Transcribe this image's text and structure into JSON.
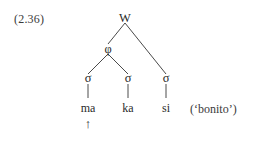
{
  "figure": {
    "example_number": "(2.36)",
    "gloss": "(‘bonito’)",
    "stroke_color": "#4a4a4a",
    "text_color": "#2b2b2b",
    "background_color": "#ffffff"
  },
  "tree": {
    "root": {
      "label": "W",
      "name": "word-node"
    },
    "level2": [
      {
        "label": "φ",
        "name": "phonological-phrase-node"
      }
    ],
    "syllables": [
      {
        "label": "σ",
        "name": "syllable-node-1"
      },
      {
        "label": "σ",
        "name": "syllable-node-2"
      },
      {
        "label": "σ",
        "name": "syllable-node-3"
      }
    ],
    "terminals": [
      {
        "text": "ma",
        "name": "terminal-ma",
        "marked": true,
        "mark": "↑"
      },
      {
        "text": "ka",
        "name": "terminal-ka",
        "marked": false,
        "mark": ""
      },
      {
        "text": "si",
        "name": "terminal-si",
        "marked": false,
        "mark": ""
      }
    ]
  }
}
